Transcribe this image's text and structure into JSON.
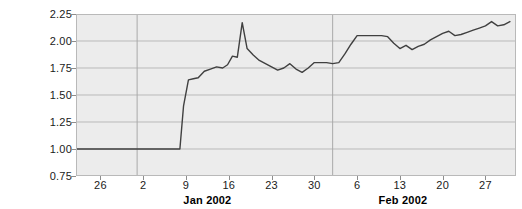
{
  "chart_data": {
    "type": "line",
    "title": "",
    "xlabel": "",
    "ylabel": "",
    "ylim": [
      0.75,
      2.25
    ],
    "yticks": [
      0.75,
      1.0,
      1.25,
      1.5,
      1.75,
      2.0,
      2.25
    ],
    "ytick_labels": [
      "0.75",
      "1.00",
      "1.25",
      "1.50",
      "1.75",
      "2.00",
      "2.25"
    ],
    "xtick_labels": [
      "26",
      "2",
      "9",
      "16",
      "23",
      "30",
      "6",
      "13",
      "20",
      "27"
    ],
    "xtick_positions": [
      0,
      7,
      14,
      21,
      28,
      35,
      42,
      49,
      56,
      63
    ],
    "xlim": [
      -4,
      68
    ],
    "month_labels": [
      {
        "text": "Jan 2002",
        "position": 17.5
      },
      {
        "text": "Feb 2002",
        "position": 49.5
      }
    ],
    "grid": true,
    "grid_color": "#b9b9b9",
    "plot_background": "#ececec",
    "line_color": "#404040",
    "line_width": 1.4,
    "legend": "none",
    "series": [
      {
        "name": "series-1",
        "x": [
          -4,
          0,
          4,
          7,
          10,
          12,
          13,
          13.6,
          14.4,
          15.2,
          16.0,
          17.0,
          18.0,
          19.0,
          20.0,
          20.8,
          21.6,
          22.4,
          23.2,
          24.0,
          25.0,
          26.0,
          27.0,
          28.0,
          29.0,
          30.0,
          31.0,
          32.0,
          33.0,
          34.0,
          35.0,
          36.0,
          37.0,
          38.0,
          39.0,
          40.0,
          41.0,
          42.0,
          44.0,
          45.0,
          46.0,
          47.0,
          48.0,
          49.0,
          50.0,
          51.0,
          52.0,
          53.0,
          54.0,
          55.0,
          56.0,
          57.0,
          58.0,
          59.0,
          60.0,
          61.0,
          62.0,
          63.0,
          64.0,
          65.0,
          66.0,
          67.0
        ],
        "y": [
          1.0,
          1.0,
          1.0,
          1.0,
          1.0,
          1.0,
          1.0,
          1.4,
          1.64,
          1.65,
          1.66,
          1.72,
          1.74,
          1.76,
          1.75,
          1.78,
          1.86,
          1.85,
          2.17,
          1.93,
          1.87,
          1.82,
          1.79,
          1.76,
          1.73,
          1.75,
          1.79,
          1.74,
          1.71,
          1.75,
          1.8,
          1.8,
          1.8,
          1.79,
          1.8,
          1.88,
          1.97,
          2.05,
          2.05,
          2.05,
          2.05,
          2.04,
          1.98,
          1.93,
          1.96,
          1.92,
          1.95,
          1.97,
          2.01,
          2.04,
          2.07,
          2.09,
          2.05,
          2.06,
          2.08,
          2.1,
          2.12,
          2.14,
          2.18,
          2.14,
          2.15,
          2.18
        ]
      }
    ]
  }
}
